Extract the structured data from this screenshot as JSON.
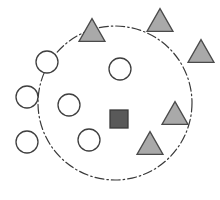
{
  "figure": {
    "name": "cluster-decision-boundary-diagram",
    "width": 220,
    "height": 200,
    "background_color": "#ffffff"
  },
  "chart_data": {
    "type": "scatter",
    "title": "",
    "subtitle": "",
    "xlabel": "",
    "ylabel": "",
    "xlim": [
      0,
      220
    ],
    "ylim": [
      0,
      200
    ],
    "grid": false,
    "axes_visible": false,
    "legend": null,
    "legend_position": "none",
    "annotations": [],
    "boundary": {
      "shape": "circle",
      "label": "decision-boundary",
      "cx": 115,
      "cy": 103,
      "r": 77,
      "stroke_color": "#3a3a3a",
      "stroke_width": 1.2,
      "line_style": "dash-dot",
      "dash_pattern": "9 3 1.5 3",
      "fill": "none"
    },
    "series": [
      {
        "name": "circles",
        "marker": "circle",
        "fill_color": "#ffffff",
        "stroke_color": "#3f3f3f",
        "stroke_width": 1.3,
        "radius": 11,
        "points": [
          {
            "id": "circle-1",
            "cx": 47,
            "cy": 62,
            "inside_boundary": false
          },
          {
            "id": "circle-2",
            "cx": 27,
            "cy": 97,
            "inside_boundary": false
          },
          {
            "id": "circle-3",
            "cx": 27,
            "cy": 142,
            "inside_boundary": false
          },
          {
            "id": "circle-4",
            "cx": 69,
            "cy": 105,
            "inside_boundary": true
          },
          {
            "id": "circle-5",
            "cx": 120,
            "cy": 69,
            "inside_boundary": true
          },
          {
            "id": "circle-6",
            "cx": 89,
            "cy": 140,
            "inside_boundary": true
          }
        ]
      },
      {
        "name": "triangles",
        "marker": "triangle",
        "fill_color": "#a9a9a9",
        "stroke_color": "#4a4a4a",
        "stroke_width": 1.3,
        "size": 26,
        "points": [
          {
            "id": "triangle-1",
            "cx": 92,
            "cy": 30,
            "inside_boundary": false
          },
          {
            "id": "triangle-2",
            "cx": 160,
            "cy": 20,
            "inside_boundary": false
          },
          {
            "id": "triangle-3",
            "cx": 201,
            "cy": 51,
            "inside_boundary": false
          },
          {
            "id": "triangle-4",
            "cx": 175,
            "cy": 113,
            "inside_boundary": true
          },
          {
            "id": "triangle-5",
            "cx": 150,
            "cy": 143,
            "inside_boundary": true
          }
        ]
      },
      {
        "name": "squares",
        "marker": "square",
        "fill_color": "#595959",
        "stroke_color": "#3a3a3a",
        "stroke_width": 1.3,
        "size": 18,
        "points": [
          {
            "id": "square-1",
            "cx": 119,
            "cy": 119,
            "inside_boundary": true
          }
        ]
      }
    ]
  }
}
